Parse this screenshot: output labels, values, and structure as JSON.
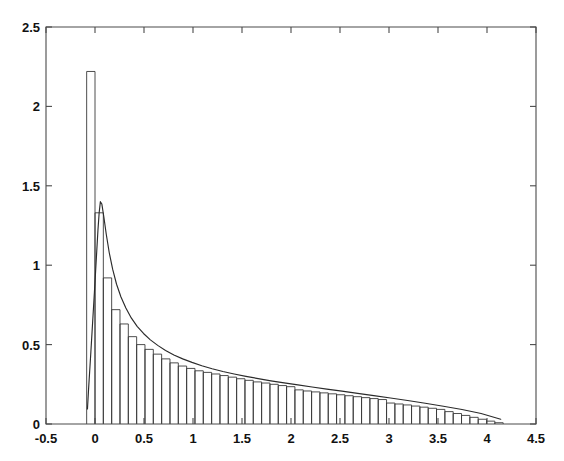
{
  "chart_data": {
    "type": "bar",
    "title": "",
    "subtitle": "",
    "xlabel": "",
    "ylabel": "",
    "xlim": [
      -0.5,
      4.5
    ],
    "ylim": [
      0,
      2.5
    ],
    "grid": false,
    "legend": null,
    "x_ticks": [
      -0.5,
      0,
      0.5,
      1,
      1.5,
      2,
      2.5,
      3,
      3.5,
      4,
      4.5
    ],
    "x_tick_labels": [
      "-0.5",
      "0",
      "0.5",
      "1",
      "1.5",
      "2",
      "2.5",
      "3",
      "3.5",
      "4",
      "4.5"
    ],
    "y_ticks": [
      0,
      0.5,
      1,
      1.5,
      2,
      2.5
    ],
    "y_tick_labels": [
      "0",
      "0.5",
      "1",
      "1.5",
      "2",
      "2.5"
    ],
    "bar_width": 0.085,
    "bar_edge_color": "#3a3a3a",
    "bar_face_color": "none",
    "series": [
      {
        "name": "histogram",
        "type": "bar",
        "x": [
          -0.0425,
          0.0425,
          0.1275,
          0.2125,
          0.2975,
          0.3825,
          0.4675,
          0.5525,
          0.6375,
          0.7225,
          0.8075,
          0.8925,
          0.9775,
          1.0625,
          1.1475,
          1.2325,
          1.3175,
          1.4025,
          1.4875,
          1.5725,
          1.6575,
          1.7425,
          1.8275,
          1.9125,
          1.9975,
          2.0825,
          2.1675,
          2.2525,
          2.3375,
          2.4225,
          2.5075,
          2.5925,
          2.6775,
          2.7625,
          2.8475,
          2.9325,
          3.0175,
          3.1025,
          3.1875,
          3.2725,
          3.3575,
          3.4425,
          3.5275,
          3.6125,
          3.6975,
          3.7825,
          3.8675,
          3.9525,
          4.0375,
          4.1225
        ],
        "values": [
          2.22,
          1.33,
          0.92,
          0.72,
          0.63,
          0.55,
          0.5,
          0.47,
          0.44,
          0.41,
          0.385,
          0.365,
          0.35,
          0.335,
          0.325,
          0.315,
          0.305,
          0.295,
          0.285,
          0.275,
          0.265,
          0.258,
          0.25,
          0.242,
          0.235,
          0.215,
          0.208,
          0.202,
          0.196,
          0.19,
          0.184,
          0.178,
          0.172,
          0.166,
          0.16,
          0.154,
          0.132,
          0.126,
          0.12,
          0.113,
          0.106,
          0.099,
          0.092,
          0.078,
          0.066,
          0.054,
          0.042,
          0.03,
          0.018,
          0.008
        ]
      },
      {
        "name": "density",
        "type": "line",
        "color": "#2b2b2b",
        "x": [
          -0.077,
          -0.066,
          -0.054,
          -0.042,
          -0.03,
          -0.018,
          -0.006,
          0.006,
          0.018,
          0.03,
          0.0425,
          0.055,
          0.07,
          0.09,
          0.115,
          0.145,
          0.18,
          0.22,
          0.265,
          0.315,
          0.37,
          0.43,
          0.495,
          0.565,
          0.64,
          0.72,
          0.805,
          0.895,
          0.99,
          1.09,
          1.195,
          1.305,
          1.42,
          1.54,
          1.665,
          1.795,
          1.93,
          2.07,
          2.215,
          2.365,
          2.52,
          2.68,
          2.845,
          3.015,
          3.19,
          3.37,
          3.555,
          3.745,
          3.94,
          4.14
        ],
        "values": [
          0.095,
          0.215,
          0.335,
          0.455,
          0.58,
          0.705,
          0.83,
          0.96,
          1.09,
          1.22,
          1.33,
          1.4,
          1.385,
          1.305,
          1.195,
          1.08,
          0.975,
          0.88,
          0.8,
          0.73,
          0.668,
          0.615,
          0.57,
          0.53,
          0.495,
          0.463,
          0.435,
          0.41,
          0.388,
          0.367,
          0.348,
          0.331,
          0.315,
          0.3,
          0.286,
          0.272,
          0.259,
          0.246,
          0.233,
          0.22,
          0.207,
          0.193,
          0.179,
          0.164,
          0.148,
          0.131,
          0.112,
          0.091,
          0.066,
          0.03
        ]
      }
    ]
  },
  "figure": {
    "background_color": "#ffffff",
    "axes_color": "#4a4a4a",
    "text_color": "#111111"
  }
}
